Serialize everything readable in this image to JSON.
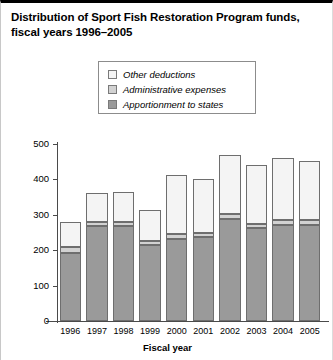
{
  "chart_data": {
    "type": "bar",
    "stacked": true,
    "title": "Distribution of Sport Fish Restoration Program funds, fiscal years 1996–2005",
    "xlabel": "Fiscal year",
    "ylabel": "Dollars in millions",
    "ylim": [
      0,
      500
    ],
    "yticks": [
      0,
      100,
      200,
      300,
      400,
      500
    ],
    "grid": false,
    "legend_position": "top-center",
    "categories": [
      "1996",
      "1997",
      "1998",
      "1999",
      "2000",
      "2001",
      "2002",
      "2003",
      "2004",
      "2005"
    ],
    "series": [
      {
        "name": "Apportionment to states",
        "color": "#9a9a9a",
        "values": [
          192,
          268,
          268,
          214,
          233,
          236,
          288,
          263,
          272,
          272
        ]
      },
      {
        "name": "Administrative expenses",
        "color": "#d2d2d2",
        "values": [
          16,
          12,
          12,
          13,
          12,
          13,
          13,
          12,
          12,
          12
        ]
      },
      {
        "name": "Other deductions",
        "color": "#f4f4f4",
        "values": [
          72,
          83,
          84,
          87,
          167,
          151,
          169,
          166,
          176,
          168
        ]
      }
    ],
    "totals": [
      280,
      363,
      364,
      314,
      412,
      400,
      470,
      441,
      460,
      452
    ]
  },
  "legend": {
    "items": [
      {
        "label": "Other deductions",
        "color": "#f4f4f4"
      },
      {
        "label": "Administrative expenses",
        "color": "#d2d2d2"
      },
      {
        "label": "Apportionment to states",
        "color": "#9a9a9a"
      }
    ]
  }
}
